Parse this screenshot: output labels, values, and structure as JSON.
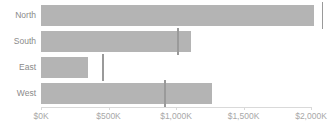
{
  "chart_data": {
    "type": "bar",
    "subtype": "bullet",
    "title": "",
    "xlabel": "",
    "ylabel": "",
    "orientation": "horizontal",
    "grid": false,
    "legend": "none",
    "xlim": [
      0,
      2000
    ],
    "x_tick_values": [
      0,
      500,
      1000,
      1500,
      2000
    ],
    "x_tick_labels": [
      "$0K",
      "$500K",
      "$1,000K",
      "$1,500K",
      "$2,000K"
    ],
    "categories": [
      "North",
      "South",
      "East",
      "West"
    ],
    "series": [
      {
        "name": "Value",
        "values": [
          2020,
          1110,
          345,
          1265
        ]
      },
      {
        "name": "Target",
        "values": [
          2085,
          1015,
          460,
          920
        ]
      }
    ],
    "colors": {
      "bar": "#b4b4b4",
      "target_marker": "#9a9a9a",
      "axis_line": "#d9d9d9",
      "category_label": "#8a8a8a",
      "tick_label": "#a8a8a8",
      "background": "#ffffff"
    }
  }
}
